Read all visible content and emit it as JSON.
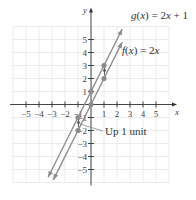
{
  "chart_data": {
    "type": "line",
    "title": "",
    "xlabel": "x",
    "ylabel": "y",
    "xlim": [
      -6,
      6
    ],
    "ylim": [
      -6,
      6
    ],
    "grid": true,
    "x_ticks": [
      -5,
      -4,
      -3,
      -2,
      -1,
      1,
      2,
      3,
      4,
      5
    ],
    "y_ticks": [
      -5,
      -4,
      -3,
      -2,
      -1,
      1,
      2,
      3,
      4,
      5
    ],
    "x_tick_labels": [
      "−5",
      "−4",
      "−3",
      "−2",
      "−1",
      "1",
      "2",
      "3",
      "4",
      "5"
    ],
    "y_tick_labels": [
      "−5",
      "−4",
      "−3",
      "−2",
      "−1",
      "1",
      "2",
      "3",
      "4",
      "5"
    ],
    "series": [
      {
        "name": "g(x) = 2x + 1",
        "label": "g(x) = 2x + 1",
        "slope": 2,
        "intercept": 1,
        "x_range": [
          -3.3,
          2.4
        ],
        "points": [
          [
            -1,
            -1
          ],
          [
            0,
            1
          ],
          [
            1,
            3
          ]
        ],
        "color": "#8c8c8c"
      },
      {
        "name": "f(x) = 2x",
        "label": "f(x) = 2x",
        "slope": 2,
        "intercept": 0,
        "x_range": [
          -2.9,
          2.4
        ],
        "points": [
          [
            -1,
            -2
          ],
          [
            0,
            0
          ],
          [
            1,
            2
          ]
        ],
        "color": "#8c8c8c"
      }
    ],
    "shift_arrows": [
      {
        "from": [
          1,
          2
        ],
        "to": [
          1,
          3
        ]
      },
      {
        "from": [
          -1,
          -2
        ],
        "to": [
          -1,
          -1
        ]
      }
    ],
    "annotations": [
      {
        "text": "Up 1 unit",
        "points_to": [
          -1,
          -1.5
        ]
      }
    ]
  }
}
